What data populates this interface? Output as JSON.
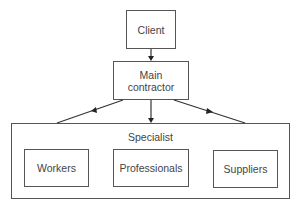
{
  "diagram": {
    "nodes": {
      "client": {
        "label": "Client"
      },
      "main_contractor": {
        "label": "Main\ncontractor",
        "line1": "Main",
        "line2": "contractor"
      },
      "specialist": {
        "label": "Specialist"
      },
      "workers": {
        "label": "Workers"
      },
      "professionals": {
        "label": "Professionals"
      },
      "suppliers": {
        "label": "Suppliers"
      }
    },
    "edges": [
      {
        "from": "Client",
        "to": "Main contractor",
        "arrow": "end"
      },
      {
        "from": "Main contractor",
        "to": "Specialist",
        "arrow": "mid",
        "side": "left"
      },
      {
        "from": "Main contractor",
        "to": "Specialist",
        "arrow": "end",
        "side": "center"
      },
      {
        "from": "Main contractor",
        "to": "Specialist",
        "arrow": "mid",
        "side": "right"
      }
    ],
    "colors": {
      "stroke": "#555555",
      "text": "#444444",
      "arrow": "#222222"
    }
  }
}
